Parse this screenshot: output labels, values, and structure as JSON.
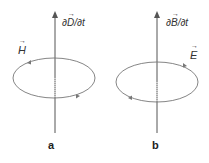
{
  "panels": [
    {
      "id": "a",
      "label": "a",
      "axis_label_prefix": "∂",
      "axis_label_vector": "D",
      "axis_label_suffix": "/∂t",
      "loop_label": "H",
      "loop_direction": "counterclockwise (viewed from above)"
    },
    {
      "id": "b",
      "label": "b",
      "axis_label_prefix": "∂",
      "axis_label_vector": "B",
      "axis_label_suffix": "/∂t",
      "loop_label": "E",
      "loop_direction": "clockwise (viewed from above)"
    }
  ],
  "colors": {
    "line": "#555555",
    "text": "#333333"
  }
}
